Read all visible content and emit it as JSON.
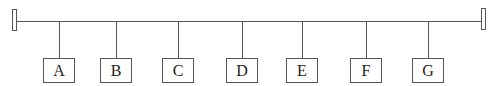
{
  "diagram": {
    "type": "bus-topology",
    "colors": {
      "line": "#555555",
      "text": "#222222",
      "background": "#ffffff"
    },
    "bus": {
      "y": 21,
      "x_start": 17,
      "x_end": 481
    },
    "terminators": [
      {
        "id": "left",
        "x": 12,
        "y": 9
      },
      {
        "id": "right",
        "x": 481,
        "y": 8
      }
    ],
    "nodes": [
      {
        "label": "A",
        "x": 43,
        "drop_x": 59
      },
      {
        "label": "B",
        "x": 100,
        "drop_x": 116
      },
      {
        "label": "C",
        "x": 162,
        "drop_x": 178
      },
      {
        "label": "D",
        "x": 226,
        "drop_x": 242
      },
      {
        "label": "E",
        "x": 286,
        "drop_x": 302
      },
      {
        "label": "F",
        "x": 350,
        "drop_x": 366
      },
      {
        "label": "G",
        "x": 412,
        "drop_x": 428
      }
    ],
    "node_top": 58
  }
}
